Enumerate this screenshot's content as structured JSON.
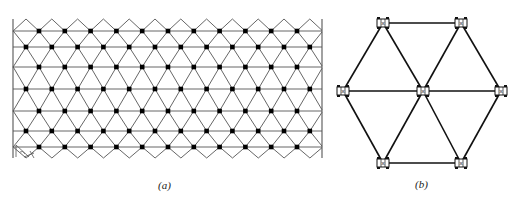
{
  "colors": {
    "line": "#555555",
    "dot": "#000000",
    "node_fill": "#ffffff",
    "node_stroke": "#111111",
    "background": "#ffffff"
  },
  "panel_a": {
    "caption": "(a)",
    "description": "Triangular lattice with nodes (dots) at intersections of horizontal and diagonal lines, bounded on left and right by vertical borders",
    "border": {
      "left_x": 13,
      "right_x": 322,
      "top_y": 19,
      "bottom_y": 158
    },
    "row_y": [
      31,
      47,
      67,
      89,
      111,
      131,
      147
    ],
    "row_parity": [
      "A",
      "B",
      "A",
      "B",
      "A",
      "B",
      "A"
    ],
    "col_spacing": 25.8,
    "a_start_x": 39,
    "b_start_x": 26,
    "top_peak_y": 19,
    "bottom_valley_y": 158,
    "corner_marker": "angle-arrow"
  },
  "panel_b": {
    "caption": "(b)",
    "description": "Hexagonal unit of 7 joint nodes connected by struts",
    "nodes": [
      {
        "id": "top-left",
        "x": 383,
        "y": 23
      },
      {
        "id": "top-right",
        "x": 461,
        "y": 23
      },
      {
        "id": "mid-left",
        "x": 343,
        "y": 91
      },
      {
        "id": "center",
        "x": 423,
        "y": 91
      },
      {
        "id": "mid-right",
        "x": 501,
        "y": 91
      },
      {
        "id": "bottom-left",
        "x": 383,
        "y": 163
      },
      {
        "id": "bottom-right",
        "x": 461,
        "y": 163
      }
    ],
    "edges": [
      [
        "top-left",
        "top-right"
      ],
      [
        "top-left",
        "mid-left"
      ],
      [
        "top-left",
        "center"
      ],
      [
        "top-right",
        "center"
      ],
      [
        "top-right",
        "mid-right"
      ],
      [
        "mid-left",
        "center"
      ],
      [
        "center",
        "mid-right"
      ],
      [
        "mid-left",
        "bottom-left"
      ],
      [
        "center",
        "bottom-left"
      ],
      [
        "center",
        "bottom-right"
      ],
      [
        "mid-right",
        "bottom-right"
      ],
      [
        "bottom-left",
        "bottom-right"
      ]
    ],
    "node_glyph": "x"
  }
}
